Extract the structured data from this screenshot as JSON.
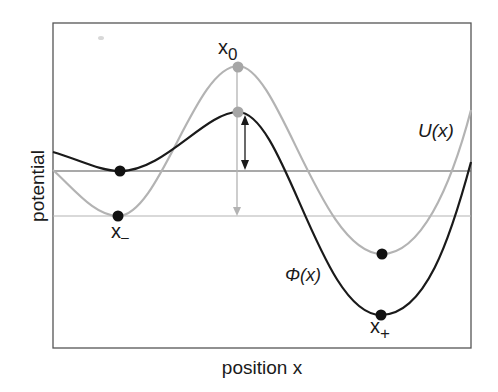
{
  "diagram": {
    "axes": {
      "xlabel": "position x",
      "ylabel": "potential"
    },
    "curves": [
      {
        "id": "U",
        "label": "U(x)",
        "color": "#b3b3b3"
      },
      {
        "id": "Phi",
        "label": "Φ(x)",
        "color": "#1a1a1a"
      }
    ],
    "points": {
      "x_minus": {
        "base": "x",
        "sub": "–"
      },
      "x_zero": {
        "base": "x",
        "sub": "0"
      },
      "x_plus": {
        "base": "x",
        "sub": "+"
      }
    },
    "reference_lines": [
      {
        "id": "phi-min-level",
        "color": "#555555"
      },
      {
        "id": "u-min-level",
        "color": "#b3b3b3"
      }
    ],
    "colors": {
      "frame": "#555555",
      "gray_curve": "#b3b3b3",
      "black_curve": "#1a1a1a",
      "marker_gray": "#a6a6a6",
      "marker_black": "#111111"
    }
  }
}
